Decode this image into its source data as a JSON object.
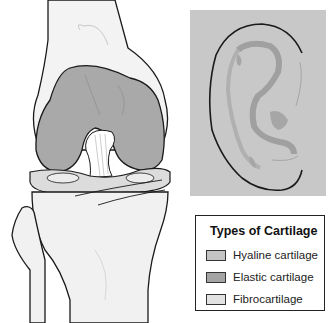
{
  "figure": {
    "knee_panel": {
      "description": "Anterior view of knee joint showing hyaline cartilage on femoral condyles and fibrocartilage menisci",
      "colors": {
        "bone": "#f2f2f2",
        "hyaline": "#a9a9a9",
        "fibro": "#dcdcdc",
        "outline": "#1a1a1a"
      }
    },
    "ear_panel": {
      "description": "External ear (auricle) containing elastic cartilage",
      "colors": {
        "background": "#c8c8c8",
        "elastic_shading": "#adadad",
        "outline": "#1a1a1a"
      }
    },
    "legend": {
      "title": "Types of Cartilage",
      "items": [
        {
          "label": "Hyaline cartilage",
          "color": "#c4c4c4"
        },
        {
          "label": "Elastic cartilage",
          "color": "#a4a4a4"
        },
        {
          "label": "Fibrocartilage",
          "color": "#e2e2e2"
        }
      ]
    }
  }
}
